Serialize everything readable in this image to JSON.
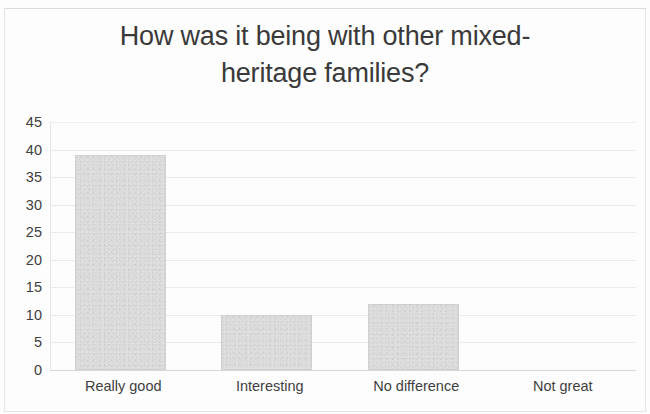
{
  "chart_data": {
    "type": "bar",
    "title_lines": [
      "How was it being with other mixed-",
      "heritage families?"
    ],
    "categories": [
      "Really good",
      "Interesting",
      "No difference",
      "Not great"
    ],
    "values": [
      39,
      10,
      12,
      0
    ],
    "xlabel": "",
    "ylabel": "",
    "ylim": [
      0,
      45
    ],
    "ytick_step": 5,
    "yticks": [
      "45",
      "40",
      "35",
      "30",
      "25",
      "20",
      "15",
      "10",
      "5",
      "0"
    ],
    "grid": true,
    "legend": false,
    "bar_color": "#dedede",
    "grid_color": "#eaeaea",
    "text_color": "#3f3f3f"
  }
}
